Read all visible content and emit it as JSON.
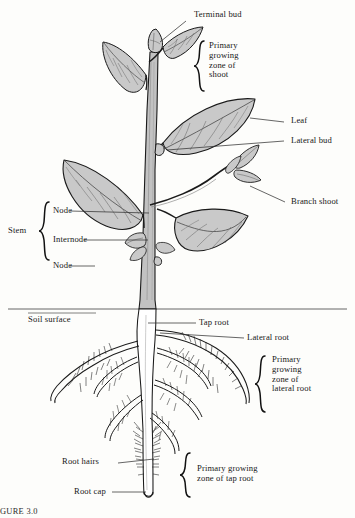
{
  "figure": {
    "caption": "GURE 3.0"
  },
  "colors": {
    "leaf_fill": "#c9c9c9",
    "stem_fill": "#c2c2c2",
    "outline": "#1a1a1a",
    "root_fill": "#ffffff",
    "leader_line": "#333333",
    "background": "#fdfdfb"
  },
  "labels": {
    "terminal_bud": "Terminal bud",
    "primary_growing_zone_shoot": "Primary\ngrowing\nzone of\nshoot",
    "leaf": "Leaf",
    "lateral_bud": "Lateral bud",
    "branch_shoot": "Branch shoot",
    "stem": "Stem",
    "node_upper": "Node",
    "internode": "Internode",
    "node_lower": "Node",
    "soil_surface": "Soil surface",
    "tap_root": "Tap root",
    "lateral_root": "Lateral root",
    "primary_growing_zone_lateral_root": "Primary\ngrowing\nzone of\nlateral root",
    "root_hairs": "Root hairs",
    "root_cap": "Root cap",
    "primary_growing_zone_tap_root": "Primary growing\nzone of tap root"
  },
  "icons": {
    "brace_shoot": "brace-icon",
    "brace_stem": "brace-icon",
    "brace_lateral_root": "brace-icon",
    "brace_tap_root": "brace-icon"
  }
}
